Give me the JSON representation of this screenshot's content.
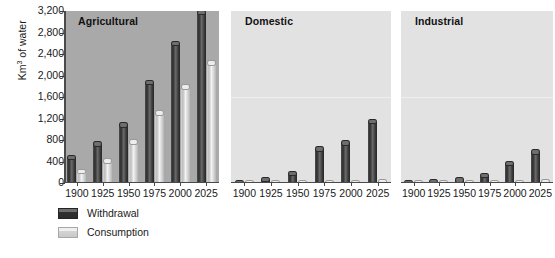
{
  "chart_data": {
    "type": "bar",
    "title": "",
    "xlabel": "",
    "ylabel": "Km3 of water",
    "ylabel_base": "Km",
    "ylabel_exp": "3",
    "ylabel_tail": " of water",
    "ylim": [
      0,
      3200
    ],
    "ytick_values": [
      0,
      400,
      800,
      1200,
      1600,
      2000,
      2400,
      2800,
      3200
    ],
    "ytick_labels": [
      "0",
      "400",
      "800",
      "1,200",
      "1,600",
      "2,000",
      "2,400",
      "2,800",
      "3,200"
    ],
    "categories": [
      "1900",
      "1925",
      "1950",
      "1975",
      "2000",
      "2025"
    ],
    "grid": false,
    "legend_position": "below-left",
    "legend": [
      "Withdrawal",
      "Consumption"
    ],
    "panels": [
      {
        "title": "Agricultural",
        "background": "#a9a9a9",
        "series": [
          {
            "name": "Withdrawal",
            "values": [
              530,
              780,
              1130,
              1920,
              2650,
              3220
            ]
          },
          {
            "name": "Consumption",
            "values": [
              270,
              460,
              810,
              1350,
              1840,
              2280
            ]
          }
        ]
      },
      {
        "title": "Domestic",
        "background": "#e2e2e2",
        "series": [
          {
            "name": "Withdrawal",
            "values": [
              60,
              120,
              230,
              680,
              800,
              1200
            ]
          },
          {
            "name": "Consumption",
            "values": [
              20,
              25,
              30,
              40,
              60,
              80
            ]
          }
        ]
      },
      {
        "title": "Industrial",
        "background": "#e2e2e2",
        "series": [
          {
            "name": "Withdrawal",
            "values": [
              30,
              70,
              110,
              190,
              410,
              630
            ]
          },
          {
            "name": "Consumption",
            "values": [
              15,
              20,
              25,
              30,
              45,
              70
            ]
          }
        ]
      }
    ]
  },
  "legend": {
    "items": [
      {
        "label": "Withdrawal",
        "swatch": "dark-gray-swatch"
      },
      {
        "label": "Consumption",
        "swatch": "light-gray-swatch"
      }
    ]
  }
}
